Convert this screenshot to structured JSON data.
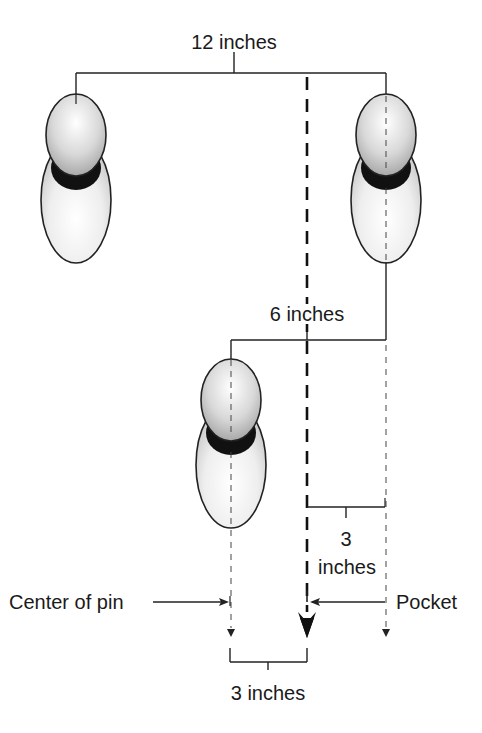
{
  "diagram": {
    "labels": {
      "top_spacing": "12 inches",
      "mid_spacing": "6 inches",
      "offset_number": "3",
      "offset_unit": "inches",
      "center_of_pin": "Center of pin",
      "pocket": "Pocket",
      "bottom_spacing": "3 inches"
    },
    "pins": [
      {
        "id": "pin-left",
        "position": "back-left"
      },
      {
        "id": "pin-right",
        "position": "back-right"
      },
      {
        "id": "pin-front",
        "position": "front"
      }
    ],
    "colors": {
      "line": "#222222",
      "pin_neck": "#111111",
      "pin_shade": "#bdbdbd",
      "pin_body": "#f4f4f4"
    }
  }
}
